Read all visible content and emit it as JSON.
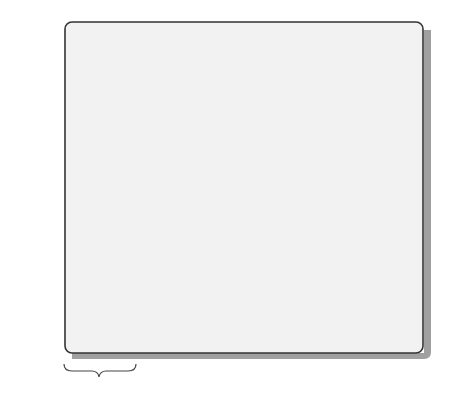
{
  "diagram": {
    "labels": {
      "vout_main": "V",
      "vout_sub": "out",
      "vin_main": "V",
      "vin_sub": "in",
      "phase_caption": "ø (phase lead)"
    },
    "colors": {
      "screen": "#f2f2f2",
      "frame": "#333333",
      "shadow": "#9a9a9a",
      "grid": "#8a8a8a",
      "axis": "#777777",
      "trace": "#a8a8a8",
      "text": "#222222"
    },
    "grid": {
      "vertical_divisions": 10,
      "horizontal_divisions": 8,
      "minor_ticks_per_division": 5
    },
    "traces": [
      {
        "name": "V_out",
        "amplitude_divisions": 2.4,
        "phase": "leading"
      },
      {
        "name": "V_in",
        "amplitude_divisions": 2.5,
        "phase": "reference"
      }
    ]
  }
}
